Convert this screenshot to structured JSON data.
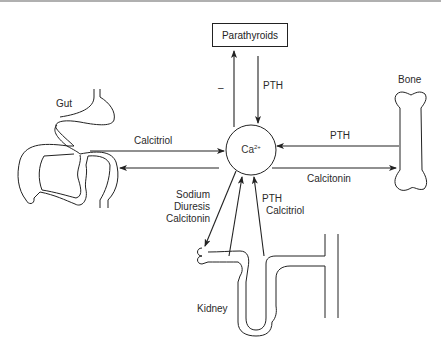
{
  "diagram": {
    "center": {
      "label": "Ca",
      "superscript": "2+"
    },
    "nodes": {
      "parathyroids": "Parathyroids",
      "gut": "Gut",
      "bone": "Bone",
      "kidney": "Kidney"
    },
    "edges": {
      "ca_to_parathyroids": "–",
      "parathyroids_to_ca": "PTH",
      "gut_to_ca": "Calcitriol",
      "bone_to_ca": "PTH",
      "ca_to_bone": "Calcitonin",
      "ca_to_kidney": [
        "Sodium",
        "Diuresis",
        "Calcitonin"
      ],
      "kidney_to_ca": [
        "PTH",
        "Calcitriol"
      ]
    },
    "colors": {
      "line": "#222222",
      "background": "#ffffff"
    }
  }
}
